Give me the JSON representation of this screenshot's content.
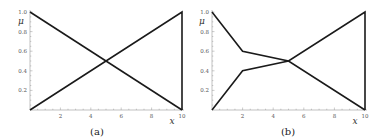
{
  "chart_data": [
    {
      "type": "line",
      "caption": "(a)",
      "xlabel": "x",
      "ylabel": "μ",
      "xlim": [
        0,
        10
      ],
      "ylim": [
        0,
        1
      ],
      "xticks": [
        2,
        4,
        6,
        8,
        10
      ],
      "xtick_labels": [
        "2",
        "4",
        "6",
        "8",
        "10"
      ],
      "yticks": [
        0.2,
        0.4,
        0.6,
        0.8,
        1.0
      ],
      "ytick_labels": [
        "0.2",
        "0.4",
        "0.6",
        "0.8",
        "1.0"
      ],
      "grid": false,
      "series": [
        {
          "name": "decreasing",
          "x": [
            0,
            10
          ],
          "y": [
            1.0,
            0.0
          ]
        },
        {
          "name": "increasing",
          "x": [
            0,
            10,
            10
          ],
          "y": [
            0.0,
            1.0,
            0.0
          ]
        }
      ]
    },
    {
      "type": "line",
      "caption": "(b)",
      "xlabel": "x",
      "ylabel": "μ",
      "xlim": [
        0,
        10
      ],
      "ylim": [
        0,
        1
      ],
      "xticks": [
        2,
        4,
        6,
        8,
        10
      ],
      "xtick_labels": [
        "2",
        "4",
        "6",
        "8",
        "10"
      ],
      "yticks": [
        0.2,
        0.4,
        0.6,
        0.8,
        1.0
      ],
      "ytick_labels": [
        "0.2",
        "0.4",
        "0.6",
        "0.8",
        "1.0"
      ],
      "grid": false,
      "series": [
        {
          "name": "decreasing",
          "x": [
            0,
            2,
            5,
            10
          ],
          "y": [
            1.0,
            0.6,
            0.5,
            0.0
          ]
        },
        {
          "name": "increasing",
          "x": [
            0,
            2,
            5,
            10,
            10
          ],
          "y": [
            0.0,
            0.4,
            0.5,
            1.0,
            0.0
          ]
        }
      ]
    }
  ],
  "colors": {
    "line": "#1a1a1a",
    "axis": "#999999",
    "text": "#555555"
  }
}
